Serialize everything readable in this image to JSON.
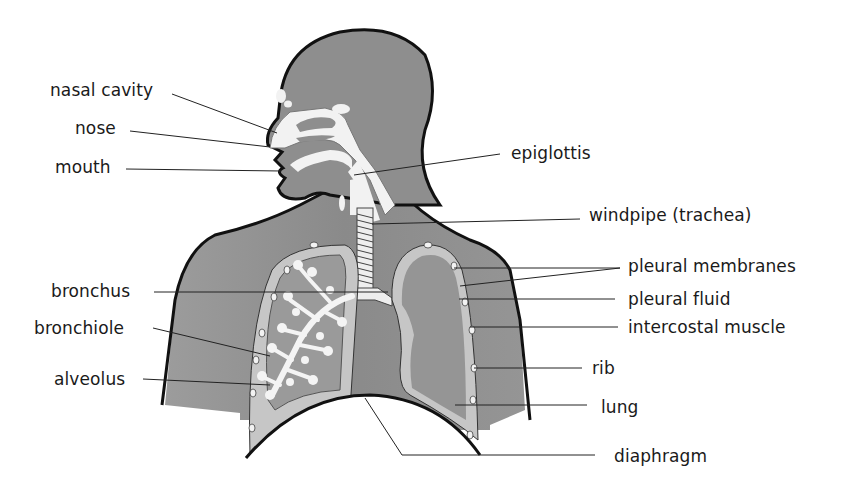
{
  "diagram": {
    "colors": {
      "body": "#8e8e8e",
      "body_light": "#a9a9a9",
      "airway": "#f3f3f3",
      "pleura": "#c4c4c4",
      "outline": "#111111",
      "leader": "#222222",
      "text": "#1a1a1a"
    },
    "labels_left": [
      {
        "id": "nasal-cavity",
        "text": "nasal cavity"
      },
      {
        "id": "nose",
        "text": "nose"
      },
      {
        "id": "mouth",
        "text": "mouth"
      },
      {
        "id": "bronchus",
        "text": "bronchus"
      },
      {
        "id": "bronchiole",
        "text": "bronchiole"
      },
      {
        "id": "alveolus",
        "text": "alveolus"
      }
    ],
    "labels_right": [
      {
        "id": "epiglottis",
        "text": "epiglottis"
      },
      {
        "id": "windpipe",
        "text": "windpipe (trachea)"
      },
      {
        "id": "pleural-membranes",
        "text": "pleural membranes"
      },
      {
        "id": "pleural-fluid",
        "text": "pleural fluid"
      },
      {
        "id": "intercostal-muscle",
        "text": "intercostal muscle"
      },
      {
        "id": "rib",
        "text": "rib"
      },
      {
        "id": "lung",
        "text": "lung"
      },
      {
        "id": "diaphragm",
        "text": "diaphragm"
      }
    ]
  }
}
